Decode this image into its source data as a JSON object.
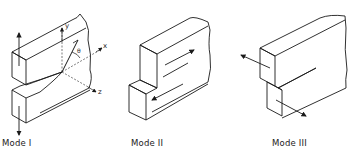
{
  "figure": {
    "panels": [
      {
        "id": "mode1",
        "label": "Mode I",
        "description": "Opening mode: tensile load perpendicular to crack plane"
      },
      {
        "id": "mode2",
        "label": "Mode II",
        "description": "Sliding mode: in-plane shear"
      },
      {
        "id": "mode3",
        "label": "Mode III",
        "description": "Tearing mode: out-of-plane shear"
      }
    ],
    "axes": {
      "x": "x",
      "y": "y",
      "z": "z",
      "angle": "θ"
    },
    "colors": {
      "line": "#1a1a1a",
      "dashed": "#555555",
      "background": "#ffffff"
    }
  }
}
